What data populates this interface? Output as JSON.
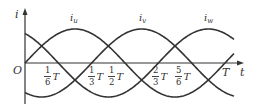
{
  "diagram": {
    "title": "",
    "axes": {
      "y_label": "i",
      "x_label": "t",
      "origin_label": "O",
      "period_label": "T"
    },
    "curves": [
      {
        "name": "i_u",
        "label_main": "i",
        "label_sub": "u",
        "phase_deg": 0
      },
      {
        "name": "i_v",
        "label_main": "i",
        "label_sub": "v",
        "phase_deg": -120
      },
      {
        "name": "i_w",
        "label_main": "i",
        "label_sub": "w",
        "phase_deg": 120
      }
    ],
    "ticks": [
      {
        "num": "1",
        "den": "6",
        "unit": "T"
      },
      {
        "num": "1",
        "den": "3",
        "unit": "T"
      },
      {
        "num": "1",
        "den": "2",
        "unit": "T"
      },
      {
        "num": "2",
        "den": "3",
        "unit": "T"
      },
      {
        "num": "5",
        "den": "6",
        "unit": "T"
      }
    ],
    "colors": {
      "stroke": "#333333",
      "background": "#ffffff"
    }
  }
}
